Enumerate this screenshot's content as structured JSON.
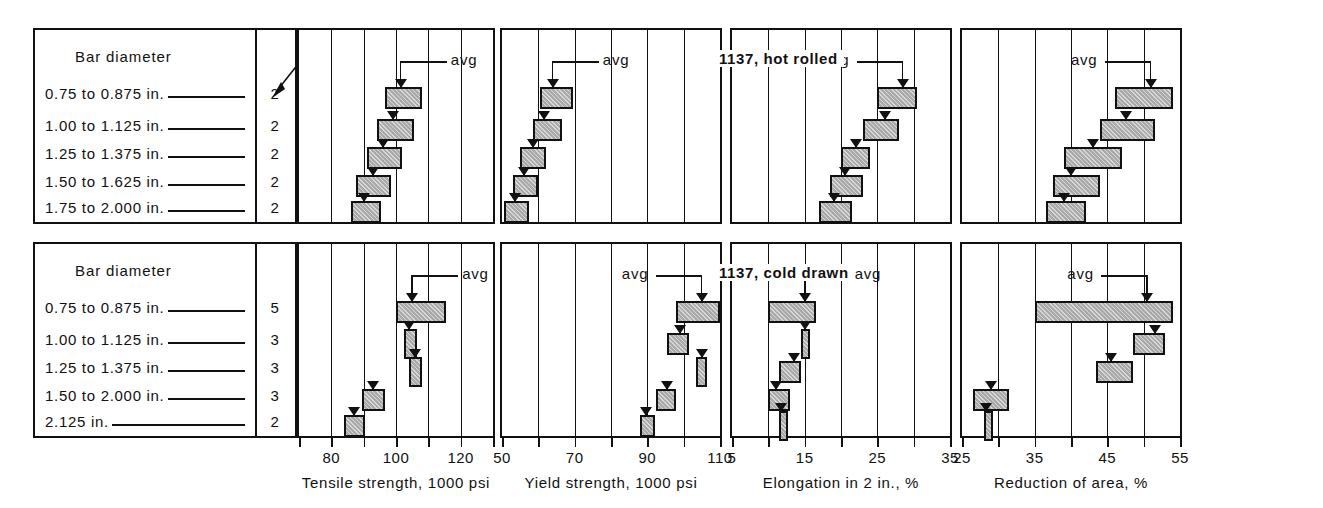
{
  "figure": {
    "headings": [
      "1137, hot rolled",
      "1137, cold drawn"
    ],
    "legend_title": "Bar diameter",
    "tests_callout": "Number of tests",
    "avg_label": "avg"
  },
  "chart_data": {
    "type": "bar",
    "orientation": "horizontal",
    "grid": true,
    "legend_position": "none",
    "panels": [
      {
        "row": "1137, hot rolled",
        "categories": [
          "0.75 to 0.875 in.",
          "1.00 to 1.125 in.",
          "1.25 to 1.375 in.",
          "1.50 to 1.625 in.",
          "1.75 to 2.000 in."
        ],
        "number_of_tests": [
          2,
          2,
          2,
          2,
          2
        ],
        "metrics": [
          {
            "xlabel": "Tensile strength, 1000 psi",
            "xlim": [
              70,
              130
            ],
            "ticks": [
              70,
              80,
              90,
              100,
              110,
              120,
              130
            ],
            "tick_labels": [
              "",
              "80",
              "",
              "100",
              "",
              "120",
              ""
            ],
            "ranges": [
              [
                96.5,
                108.0
              ],
              [
                94.0,
                105.5
              ],
              [
                91.0,
                102.0
              ],
              [
                87.5,
                98.5
              ],
              [
                86.0,
                95.5
              ]
            ],
            "avg": [
              101.5,
              99.0,
              96.0,
              93.0,
              90.0
            ]
          },
          {
            "xlabel": "Yield strength, 1000 psi",
            "xlim": [
              50,
              110
            ],
            "ticks": [
              50,
              60,
              70,
              80,
              90,
              100,
              110
            ],
            "tick_labels": [
              "50",
              "",
              "70",
              "",
              "90",
              "",
              "110"
            ],
            "ranges": [
              [
                60.5,
                69.5
              ],
              [
                58.5,
                66.5
              ],
              [
                55.0,
                62.0
              ],
              [
                53.0,
                60.0
              ],
              [
                50.5,
                57.5
              ]
            ],
            "avg": [
              64.0,
              61.5,
              58.5,
              56.0,
              53.5
            ]
          },
          {
            "xlabel": "Elongation in 2 in., %",
            "xlim": [
              5,
              35
            ],
            "ticks": [
              5,
              10,
              15,
              20,
              25,
              30,
              35
            ],
            "tick_labels": [
              "5",
              "",
              "15",
              "",
              "25",
              "",
              "35"
            ],
            "ranges": [
              [
                25.0,
                30.5
              ],
              [
                23.0,
                28.0
              ],
              [
                20.0,
                24.0
              ],
              [
                18.5,
                23.0
              ],
              [
                17.0,
                21.5
              ]
            ],
            "avg": [
              28.5,
              26.0,
              22.0,
              20.5,
              19.0
            ]
          },
          {
            "xlabel": "Reduction of area, %",
            "xlim": [
              25,
              55
            ],
            "ticks": [
              25,
              30,
              35,
              40,
              45,
              50,
              55
            ],
            "tick_labels": [
              "25",
              "",
              "35",
              "",
              "45",
              "",
              "55"
            ],
            "ranges": [
              [
                46.0,
                54.0
              ],
              [
                44.0,
                51.5
              ],
              [
                39.0,
                47.0
              ],
              [
                37.5,
                44.0
              ],
              [
                36.5,
                42.0
              ]
            ],
            "avg": [
              51.0,
              47.5,
              43.0,
              40.0,
              39.0
            ]
          }
        ]
      },
      {
        "row": "1137, cold drawn",
        "categories": [
          "0.75 to 0.875 in.",
          "1.00 to 1.125 in.",
          "1.25 to 1.375 in.",
          "1.50 to 2.000 in.",
          "2.125 in."
        ],
        "number_of_tests": [
          5,
          3,
          3,
          3,
          2
        ],
        "metrics": [
          {
            "xlabel": "Tensile strength, 1000 psi",
            "xlim": [
              70,
              130
            ],
            "ticks": [
              70,
              80,
              90,
              100,
              110,
              120,
              130
            ],
            "tick_labels": [
              "",
              "80",
              "",
              "100",
              "",
              "120",
              ""
            ],
            "ranges": [
              [
                100.0,
                115.5
              ],
              [
                102.5,
                106.5
              ],
              [
                104.0,
                108.0
              ],
              [
                89.5,
                96.5
              ],
              [
                84.0,
                90.5
              ]
            ],
            "avg": [
              105.0,
              104.0,
              106.0,
              93.0,
              87.0
            ]
          },
          {
            "xlabel": "Yield strength, 1000 psi",
            "xlim": [
              50,
              110
            ],
            "ticks": [
              50,
              60,
              70,
              80,
              90,
              100,
              110
            ],
            "tick_labels": [
              "50",
              "",
              "70",
              "",
              "90",
              "",
              "110"
            ],
            "ranges": [
              [
                98.0,
                110.0
              ],
              [
                95.5,
                101.5
              ],
              [
                103.5,
                106.5
              ],
              [
                92.5,
                98.0
              ],
              [
                88.0,
                92.0
              ]
            ],
            "avg": [
              105.0,
              99.0,
              105.0,
              95.5,
              89.5
            ]
          },
          {
            "xlabel": "Elongation in 2 in., %",
            "xlim": [
              5,
              35
            ],
            "ticks": [
              5,
              10,
              15,
              20,
              25,
              30,
              35
            ],
            "tick_labels": [
              "5",
              "",
              "15",
              "",
              "25",
              "",
              "35"
            ],
            "ranges": [
              [
                10.0,
                16.5
              ],
              [
                14.5,
                15.5
              ],
              [
                11.5,
                14.5
              ],
              [
                10.0,
                13.0
              ],
              [
                11.5,
                12.0
              ]
            ],
            "avg": [
              15.0,
              15.0,
              13.5,
              11.0,
              11.8
            ]
          },
          {
            "xlabel": "Reduction of area, %",
            "xlim": [
              25,
              55
            ],
            "ticks": [
              25,
              30,
              35,
              40,
              45,
              50,
              55
            ],
            "tick_labels": [
              "25",
              "",
              "35",
              "",
              "45",
              "",
              "55"
            ],
            "ranges": [
              [
                35.0,
                54.0
              ],
              [
                48.5,
                53.0
              ],
              [
                43.5,
                48.5
              ],
              [
                26.5,
                31.5
              ],
              [
                28.0,
                28.7
              ]
            ],
            "avg": [
              50.5,
              51.5,
              45.5,
              29.0,
              28.3
            ]
          }
        ]
      }
    ]
  },
  "axes": {
    "titles": [
      "Tensile strength, 1000 psi",
      "Yield strength, 1000 psi",
      "Elongation in 2 in., %",
      "Reduction of area, %"
    ]
  },
  "colors": {
    "ink": "#111111",
    "bar_fill": "#a9a9a9",
    "paper": "#ffffff"
  }
}
